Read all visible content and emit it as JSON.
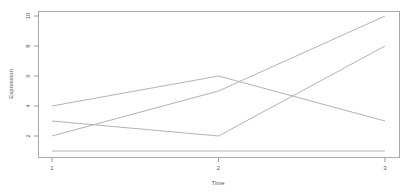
{
  "chart_data": {
    "type": "line",
    "title": "",
    "xlabel": "Time",
    "ylabel": "Expression",
    "x": [
      1,
      2,
      3
    ],
    "xticks": [
      "1",
      "2",
      "3"
    ],
    "yticks": [
      "2",
      "4",
      "6",
      "8",
      "10"
    ],
    "ytick_values": [
      2,
      4,
      6,
      8,
      10
    ],
    "xlim": [
      0.92,
      3.08
    ],
    "ylim": [
      0.64,
      10.36
    ],
    "grid": false,
    "legend": null,
    "series": [
      {
        "name": "series-1",
        "values": [
          2,
          5,
          10
        ]
      },
      {
        "name": "series-2",
        "values": [
          4,
          6,
          3
        ]
      },
      {
        "name": "series-3",
        "values": [
          3,
          2,
          8
        ]
      },
      {
        "name": "series-4",
        "values": [
          1,
          1,
          1
        ]
      }
    ]
  },
  "style": {
    "line_color": "#b3b3b3",
    "axis_color": "#999999",
    "text_color": "#555555"
  }
}
